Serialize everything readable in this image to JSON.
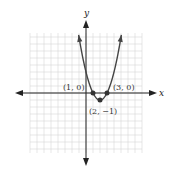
{
  "chart_data": {
    "type": "line",
    "title": "",
    "function": "y = (x - 1)(x - 3) = x^2 - 4x + 3",
    "xlabel": "x",
    "ylabel": "y",
    "xlim": [
      -8,
      8
    ],
    "ylim": [
      -8.5,
      8.5
    ],
    "grid": true,
    "legend": null,
    "series": [
      {
        "name": "parabola",
        "x": [
          -1.1,
          -0.5,
          0,
          0.5,
          1,
          1.5,
          2,
          2.5,
          3,
          3.5,
          4,
          4.5,
          5.1
        ],
        "y": [
          7.61,
          5.25,
          3,
          1.25,
          0,
          -0.75,
          -1,
          -0.75,
          0,
          1.25,
          3,
          5.25,
          8.61
        ]
      }
    ],
    "annotations": [
      {
        "label": "(1, 0)",
        "x": 1,
        "y": 0
      },
      {
        "label": "(3, 0)",
        "x": 3,
        "y": 0
      },
      {
        "label": "(2, −1)",
        "x": 2,
        "y": -1
      }
    ]
  },
  "labels": {
    "x_axis": "x",
    "y_axis": "y",
    "point1": "(1, 0)",
    "point2": "(3, 0)",
    "vertex": "(2, −1)"
  }
}
